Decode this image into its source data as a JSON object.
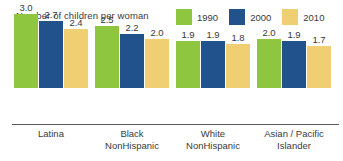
{
  "chart_data": {
    "type": "bar",
    "title": "Number of children per woman",
    "xlabel": "",
    "ylabel": "",
    "ylim": [
      0,
      3.0
    ],
    "grid": false,
    "legend_position": "top-right",
    "categories": [
      "Latina",
      "Black NonHispanic",
      "White NonHispanic",
      "Asian / Pacific Islander"
    ],
    "category_lines": [
      [
        "Latina"
      ],
      [
        "Black",
        "NonHispanic"
      ],
      [
        "White",
        "NonHispanic"
      ],
      [
        "Asian / Pacific",
        "Islander"
      ]
    ],
    "series": [
      {
        "name": "1990",
        "color": "#8EC63F",
        "values": [
          3.0,
          2.5,
          1.9,
          2.0
        ]
      },
      {
        "name": "2000",
        "color": "#21528C",
        "values": [
          2.7,
          2.2,
          1.9,
          1.9
        ]
      },
      {
        "name": "2010",
        "color": "#F0CE72",
        "values": [
          2.4,
          2.0,
          1.8,
          1.7
        ]
      }
    ],
    "value_labels": [
      [
        "3.0",
        "2.7",
        "2.4"
      ],
      [
        "2.5",
        "2.2",
        "2.0"
      ],
      [
        "1.9",
        "1.9",
        "1.8"
      ],
      [
        "2.0",
        "1.9",
        "1.7"
      ]
    ],
    "axis_color": "#5a5a5a",
    "text_color": "#3a3a3a",
    "background": "#ffffff"
  }
}
